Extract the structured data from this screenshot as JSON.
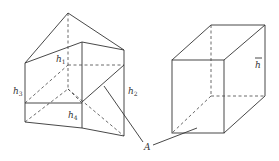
{
  "diagram": {
    "prism": {
      "labels": {
        "h1": {
          "base": "h",
          "sub": "1"
        },
        "h2": {
          "base": "h",
          "sub": "2"
        },
        "h3": {
          "base": "h",
          "sub": "3"
        },
        "h4": {
          "base": "h",
          "sub": "4"
        }
      }
    },
    "box": {
      "label": {
        "base": "h",
        "overline": true
      }
    },
    "pointer_label": "A"
  }
}
